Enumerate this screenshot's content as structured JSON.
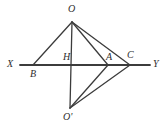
{
  "figure": {
    "type": "geometry-diagram",
    "width": 164,
    "height": 133,
    "background_color": "#ffffff",
    "stroke_color": "#3c3c3c",
    "label_color": "#2e2e2e",
    "stroke_width": 1.4,
    "axis_stroke_width": 1.8
  },
  "labels": {
    "O": "O",
    "O_prime": "O'",
    "X": "X",
    "Y": "Y",
    "B": "B",
    "H": "H",
    "A": "A",
    "C": "C"
  },
  "points": {
    "O": {
      "x": 72,
      "y": 22
    },
    "O_prime": {
      "x": 70,
      "y": 108
    },
    "H": {
      "x": 72,
      "y": 65
    },
    "B": {
      "x": 33,
      "y": 65
    },
    "A": {
      "x": 108,
      "y": 65
    },
    "C": {
      "x": 130,
      "y": 65
    },
    "X_end": {
      "x": 20,
      "y": 65
    },
    "Y_end": {
      "x": 150,
      "y": 65
    }
  },
  "label_positions": {
    "O": {
      "x": 68,
      "y": 4
    },
    "O_prime": {
      "x": 63,
      "y": 112
    },
    "X": {
      "x": 7,
      "y": 59
    },
    "Y": {
      "x": 153,
      "y": 59
    },
    "B": {
      "x": 30,
      "y": 69
    },
    "H": {
      "x": 63,
      "y": 52
    },
    "A": {
      "x": 106,
      "y": 52
    },
    "C": {
      "x": 127,
      "y": 50
    }
  },
  "segments": [
    {
      "name": "axis-XY",
      "from": "X_end",
      "to": "Y_end",
      "kind": "axis"
    },
    {
      "name": "O-to-B",
      "from": "O",
      "to": "B",
      "kind": "edge"
    },
    {
      "name": "O-to-Oprime",
      "from": "O",
      "to": "O_prime",
      "kind": "edge"
    },
    {
      "name": "O-to-A",
      "from": "O",
      "to": "A",
      "kind": "edge"
    },
    {
      "name": "O-to-C",
      "from": "O",
      "to": "C",
      "kind": "edge"
    },
    {
      "name": "Oprime-to-A",
      "from": "O_prime",
      "to": "A",
      "kind": "edge"
    },
    {
      "name": "Oprime-to-C",
      "from": "O_prime",
      "to": "C",
      "kind": "edge"
    }
  ]
}
